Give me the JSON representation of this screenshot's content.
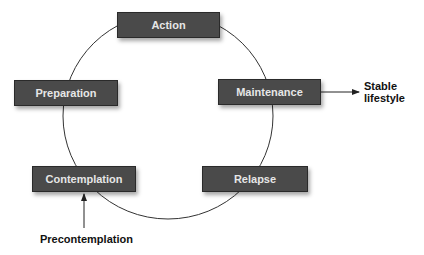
{
  "diagram": {
    "type": "cycle",
    "stages": [
      {
        "id": "action",
        "label": "Action"
      },
      {
        "id": "maintenance",
        "label": "Maintenance"
      },
      {
        "id": "relapse",
        "label": "Relapse"
      },
      {
        "id": "contemplation",
        "label": "Contemplation"
      },
      {
        "id": "preparation",
        "label": "Preparation"
      }
    ],
    "exit_label_line1": "Stable",
    "exit_label_line2": "lifestyle",
    "entry_label": "Precontemplation",
    "colors": {
      "box_fill": "#4a4a4a",
      "box_text": "#e6e6e6",
      "line": "#333333",
      "label_text": "#111111"
    }
  }
}
